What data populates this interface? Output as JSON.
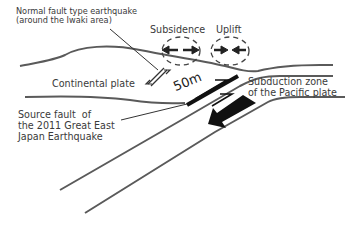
{
  "diagram": {
    "labels": {
      "normal_fault": "Normal fault type earthquake\n(around the Iwaki area)",
      "subsidence": "Subsidence",
      "uplift": "Uplift",
      "continental_plate": "Continental plate",
      "displacement": "50m",
      "subduction_zone": "Subduction zone\nof the Pacific plate",
      "source_fault": "Source fault  of\nthe 2011 Great East\nJapan Earthquake"
    },
    "colors": {
      "line": "#5a5a5a",
      "fault": "#111111",
      "arrow": "#111111",
      "text": "#3a3a3a"
    }
  }
}
